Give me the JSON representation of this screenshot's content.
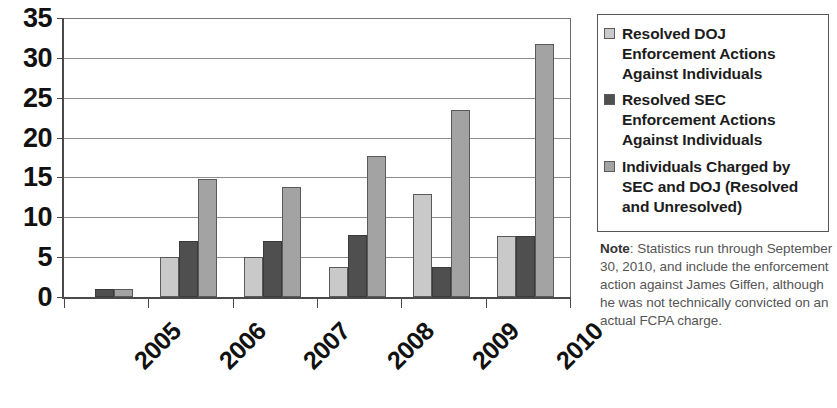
{
  "chart_data": {
    "type": "bar",
    "title": "",
    "subtitle": "",
    "xlabel": "",
    "ylabel": "",
    "categories": [
      "2005",
      "2006",
      "2007",
      "2008",
      "2009",
      "2010"
    ],
    "ylim": [
      0,
      35
    ],
    "yticks": [
      0,
      5,
      10,
      15,
      20,
      25,
      30,
      35
    ],
    "ytick_labels": [
      "0",
      "5",
      "10",
      "15",
      "20",
      "25",
      "30",
      "35"
    ],
    "grid": true,
    "legend_position": "right",
    "series": [
      {
        "name": "Resolved DOJ Enforcement Actions Against Individuals",
        "color": "#c9c9c9",
        "values": [
          0,
          5,
          5,
          3.8,
          12.9,
          7.7
        ]
      },
      {
        "name": "Resolved SEC Enforcement Actions Against Individuals",
        "color": "#4f4f4f",
        "values": [
          1,
          7,
          7,
          7.8,
          3.8,
          7.7
        ]
      },
      {
        "name": "Individuals Charged by SEC and DOJ (Resolved and Unresolved)",
        "color": "#a3a3a3",
        "values": [
          1,
          14.8,
          13.8,
          17.7,
          23.5,
          31.8
        ]
      }
    ]
  },
  "legend": {
    "entries": [
      {
        "label": "Resolved DOJ Enforcement Actions Against Individuals",
        "swatch": "light-gray-swatch"
      },
      {
        "label": "Resolved SEC Enforcement Actions Against Individuals",
        "swatch": "dark-gray-swatch"
      },
      {
        "label": "Individuals Charged by SEC and DOJ (Resolved and Unresolved)",
        "swatch": "medium-gray-swatch"
      }
    ]
  },
  "note": {
    "label": "Note",
    "separator": ":",
    "text": " Statistics run through September 30, 2010, and include the enforcement action against James Giffen, although he was not technically convicted on an actual FCPA charge."
  }
}
